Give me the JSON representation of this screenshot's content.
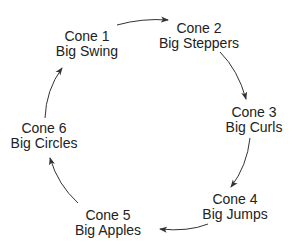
{
  "diagram": {
    "type": "cycle",
    "direction": "clockwise",
    "nodes": [
      {
        "id": "cone1",
        "title": "Cone 1",
        "subtitle": "Big Swing"
      },
      {
        "id": "cone2",
        "title": "Cone 2",
        "subtitle": "Big Steppers"
      },
      {
        "id": "cone3",
        "title": "Cone 3",
        "subtitle": "Big Curls"
      },
      {
        "id": "cone4",
        "title": "Cone 4",
        "subtitle": "Big Jumps"
      },
      {
        "id": "cone5",
        "title": "Cone 5",
        "subtitle": "Big Apples"
      },
      {
        "id": "cone6",
        "title": "Cone 6",
        "subtitle": "Big Circles"
      }
    ],
    "edges": [
      {
        "from": "cone1",
        "to": "cone2"
      },
      {
        "from": "cone2",
        "to": "cone3"
      },
      {
        "from": "cone3",
        "to": "cone4"
      },
      {
        "from": "cone4",
        "to": "cone5"
      },
      {
        "from": "cone5",
        "to": "cone6"
      },
      {
        "from": "cone6",
        "to": "cone1"
      }
    ],
    "colors": {
      "text": "#222222",
      "arrow": "#333333",
      "background": "#ffffff"
    }
  }
}
